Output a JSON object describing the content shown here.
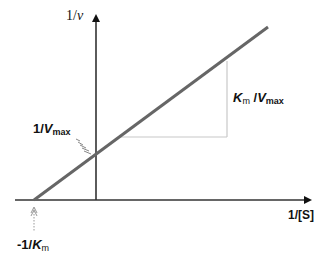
{
  "diagram": {
    "y_axis_label": {
      "prefix": "1/",
      "var": "v"
    },
    "x_axis_label": "1/[S]",
    "y_intercept_label": {
      "prefix": "1/",
      "var": "V",
      "sub": "max"
    },
    "x_intercept_label": {
      "prefix": "-1/",
      "var": "K",
      "sub": "m"
    },
    "slope_label": {
      "var1": "K",
      "sub1": "m",
      "sep": " /",
      "var2": "V",
      "sub2": "max"
    },
    "colors": {
      "axis": "#222222",
      "line": "#666666",
      "slope_triangle": "#c8c8c8",
      "pointer": "#888888"
    }
  }
}
